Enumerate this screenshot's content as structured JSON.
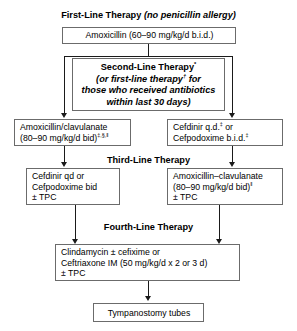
{
  "diagram": {
    "title_first_line": {
      "bold_text": "First-Line Therapy",
      "italic_text": "(no penicillin allergy)"
    },
    "first_line_box": {
      "text": "Amoxicillin (60–90 mg/kg/d b.i.d.)"
    },
    "second_line_header_box": {
      "line1": "Second-Line Therapy",
      "line1_sup": "*",
      "line2a": "(or first-line therapy",
      "line2_sup": "†",
      "line2b": " for",
      "line3": "those who received antibiotics",
      "line4": "within last 30 days)"
    },
    "second_line_left_box": {
      "line1": "Amoxicillin/clavulanate",
      "line2": "(80–90 mg/kg/d bid)",
      "line2_sup": "‡,§,‖"
    },
    "second_line_right_box": {
      "line1a": "Cefdinir q.d.",
      "line1_sup": "‡",
      "line1b": " or",
      "line2a": "Cefpodoxime b.i.d.",
      "line2_sup": "‡"
    },
    "third_line_header": "Third-Line Therapy",
    "third_line_left_box": {
      "line1": "Cefdinir qd or",
      "line2": "Cefpodoxime bid",
      "line3": "± TPC"
    },
    "third_line_right_box": {
      "line1": "Amoxicillin–clavulanate",
      "line2": "(80–90 mg/kg/d bid)",
      "line2_sup": "‖",
      "line3": "± TPC"
    },
    "fourth_line_header": "Fourth-Line Therapy",
    "fourth_line_box": {
      "line1": "Clindamycin ± cefixime or",
      "line2": "Ceftriaxone IM (50 mg/kg/d x 2 or 3 d)",
      "line3": "± TPC"
    },
    "final_box": {
      "text": "Tympanostomy tubes"
    }
  }
}
